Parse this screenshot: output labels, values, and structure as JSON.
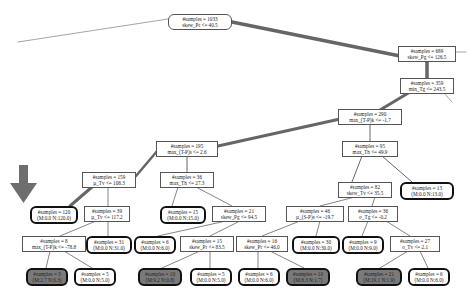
{
  "diagram": {
    "type": "decision-tree",
    "highlight_arrow_target": "n4",
    "nodes": [
      {
        "id": "root",
        "line1": "#samples = 1033",
        "line2": "skew_Pr <= 40.5",
        "kind": "root",
        "x": 168,
        "y": 14,
        "w": 64
      },
      {
        "id": "n1",
        "line1": "#samples = 689",
        "line2": "skew_Pg <= 126.5",
        "kind": "split",
        "x": 398,
        "y": 46,
        "w": 58
      },
      {
        "id": "n2",
        "line1": "#samples = 359",
        "line2": "min_Tg <= 243.5",
        "kind": "split",
        "x": 400,
        "y": 78,
        "w": 54
      },
      {
        "id": "n3",
        "line1": "#samples = 290",
        "line2": "max_(T-P)k <= -1.7",
        "kind": "split",
        "x": 338,
        "y": 109,
        "w": 64
      },
      {
        "id": "n5",
        "line1": "#samples = 195",
        "line2": "max_(T-P)s <= 2.6",
        "kind": "split",
        "x": 156,
        "y": 141,
        "w": 62
      },
      {
        "id": "n6",
        "line1": "#samples = 95",
        "line2": "max_Th <= 49.9",
        "kind": "split",
        "x": 342,
        "y": 141,
        "w": 56
      },
      {
        "id": "n7",
        "line1": "#samples = 159",
        "line2": "µ_Tv <= 108.3",
        "kind": "split",
        "x": 82,
        "y": 172,
        "w": 54
      },
      {
        "id": "n8",
        "line1": "#samples = 36",
        "line2": "max_Th <= 27.3",
        "kind": "split",
        "x": 160,
        "y": 172,
        "w": 54
      },
      {
        "id": "n9",
        "line1": "#samples = 82",
        "line2": "skew_Tv <= 35.5",
        "kind": "split",
        "x": 338,
        "y": 182,
        "w": 54
      },
      {
        "id": "n10",
        "line1": "#samples = 13",
        "line2": "(M:0.0 N:13.0)",
        "kind": "leaf",
        "x": 400,
        "y": 182,
        "w": 54
      },
      {
        "id": "n4",
        "line1": "#samples = 120",
        "line2": "(M:0.0 N:120.0)",
        "kind": "leaf",
        "x": 30,
        "y": 206,
        "w": 48
      },
      {
        "id": "n11",
        "line1": "#samples = 39",
        "line2": "µ_Tv <= 117.2",
        "kind": "split",
        "x": 84,
        "y": 206,
        "w": 46
      },
      {
        "id": "n12",
        "line1": "#samples = 15",
        "line2": "(M:0.0 N:15.0)",
        "kind": "leaf",
        "x": 160,
        "y": 206,
        "w": 46
      },
      {
        "id": "n13",
        "line1": "#samples = 21",
        "line2": "skew_Pg <= 94.5",
        "kind": "split",
        "x": 212,
        "y": 206,
        "w": 54
      },
      {
        "id": "n14",
        "line1": "#samples = 46",
        "line2": "µ_(S-P)s <= -19.7",
        "kind": "split",
        "x": 286,
        "y": 206,
        "w": 58
      },
      {
        "id": "n15",
        "line1": "#samples = 36",
        "line2": "σ_Tg <= -0.2",
        "kind": "split",
        "x": 348,
        "y": 206,
        "w": 50
      },
      {
        "id": "n16",
        "line1": "#samples = 8",
        "line2": "max_(T-P)k <= -78.8",
        "kind": "split",
        "x": 22,
        "y": 236,
        "w": 64
      },
      {
        "id": "n17",
        "line1": "#samples = 31",
        "line2": "(M:0.0 N:31.0)",
        "kind": "leaf",
        "x": 86,
        "y": 236,
        "w": 46
      },
      {
        "id": "n18",
        "line1": "#samples = 6",
        "line2": "(M:0.0 N:6.0)",
        "kind": "leaf",
        "x": 134,
        "y": 236,
        "w": 42
      },
      {
        "id": "n19",
        "line1": "#samples = 15",
        "line2": "skew_Pr <= 83.5",
        "kind": "split",
        "x": 180,
        "y": 236,
        "w": 54
      },
      {
        "id": "n20",
        "line1": "#samples = 16",
        "line2": "skew_Pr <= 46.0",
        "kind": "split",
        "x": 236,
        "y": 236,
        "w": 52
      },
      {
        "id": "n21",
        "line1": "#samples = 30",
        "line2": "(M:0.0 N:30.0)",
        "kind": "leaf",
        "x": 292,
        "y": 236,
        "w": 48
      },
      {
        "id": "n22",
        "line1": "#samples = 9",
        "line2": "(M:0.0 N:9.0)",
        "kind": "leaf",
        "x": 342,
        "y": 236,
        "w": 42
      },
      {
        "id": "n23",
        "line1": "#samples = 27",
        "line2": "σ_Tv <= 2.1",
        "kind": "split",
        "x": 390,
        "y": 236,
        "w": 50
      },
      {
        "id": "n24",
        "line1": "#samples = 3",
        "line2": "(M:2.7 N:0.3)",
        "kind": "leaf-dark",
        "x": 26,
        "y": 268,
        "w": 42
      },
      {
        "id": "n25",
        "line1": "#samples = 5",
        "line2": "(M:0.0 N:5.0)",
        "kind": "leaf",
        "x": 74,
        "y": 268,
        "w": 42
      },
      {
        "id": "n26",
        "line1": "#samples = 10",
        "line2": "(M:9.2 N:0.8)",
        "kind": "leaf-dark",
        "x": 138,
        "y": 268,
        "w": 44
      },
      {
        "id": "n27",
        "line1": "#samples = 5",
        "line2": "(M:0.0 N:5.0)",
        "kind": "leaf",
        "x": 190,
        "y": 268,
        "w": 42
      },
      {
        "id": "n28",
        "line1": "#samples = 6",
        "line2": "(M:0.0 N:6.0)",
        "kind": "leaf",
        "x": 238,
        "y": 268,
        "w": 42
      },
      {
        "id": "n29",
        "line1": "#samples = 10",
        "line2": "(M:8.3 N:1.7)",
        "kind": "leaf-dark",
        "x": 286,
        "y": 268,
        "w": 44
      },
      {
        "id": "n30",
        "line1": "#samples = 21",
        "line2": "(M:19.1 N:1.9)",
        "kind": "leaf-dark",
        "x": 356,
        "y": 268,
        "w": 46
      },
      {
        "id": "n31",
        "line1": "#samples = 6",
        "line2": "(M:0.0 N:6.0)",
        "kind": "leaf",
        "x": 408,
        "y": 268,
        "w": 42
      }
    ],
    "colors": {
      "edge": "#666666",
      "dark_leaf": "#7a7a7a",
      "arrow": "#6e6e6e"
    }
  }
}
